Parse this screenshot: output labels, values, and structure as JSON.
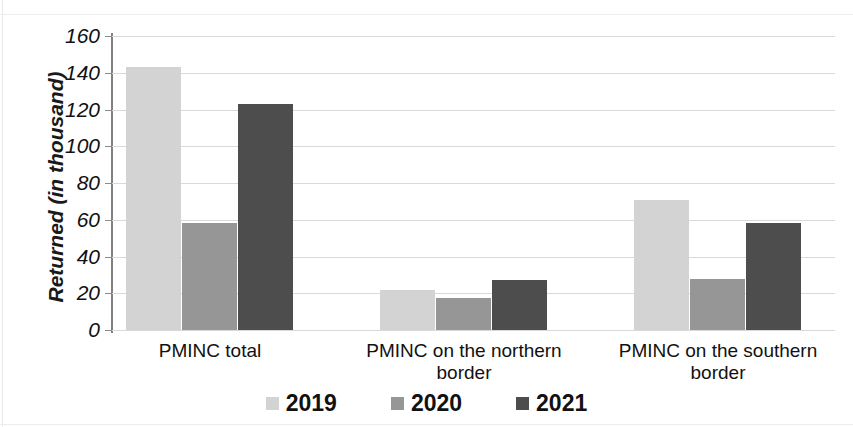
{
  "chart_data": {
    "type": "bar",
    "title": "",
    "subtitle": "",
    "xlabel": "",
    "ylabel": "Returned (in thousand)",
    "ylim": [
      0,
      160
    ],
    "ytick_step": 20,
    "yticks": [
      0,
      20,
      40,
      60,
      80,
      100,
      120,
      140,
      160
    ],
    "grid": "horizontal",
    "legend_position": "bottom",
    "categories": [
      "PMINC total",
      "PMINC on the northern border",
      "PMINC on the southern border"
    ],
    "category_lines": [
      [
        "PMINC total"
      ],
      [
        "PMINC on the northern",
        "border"
      ],
      [
        "PMINC on the southern",
        "border"
      ]
    ],
    "series": [
      {
        "name": "2019",
        "color": "#d3d3d3",
        "values": [
          143,
          22,
          70.5
        ]
      },
      {
        "name": "2020",
        "color": "#969696",
        "values": [
          58,
          17.5,
          28
        ]
      },
      {
        "name": "2021",
        "color": "#4d4d4d",
        "values": [
          123,
          27,
          58.5
        ]
      }
    ]
  }
}
